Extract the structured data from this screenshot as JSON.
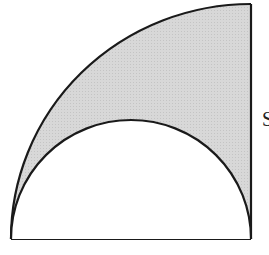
{
  "figure": {
    "shaded_color": "#d6d6d6",
    "stroke_color": "#1a1a1a",
    "side_label": "S",
    "quarter_circle": {
      "center": [
        251,
        239
      ],
      "radius": 235
    },
    "semicircle": {
      "center": [
        131,
        239
      ],
      "radius": 120
    }
  }
}
